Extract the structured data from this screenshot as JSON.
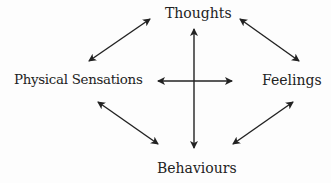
{
  "diagram": {
    "type": "cbt-cycle",
    "nodes": [
      {
        "id": "thoughts",
        "label": "Thoughts"
      },
      {
        "id": "physical",
        "label": "Physical Sensations"
      },
      {
        "id": "feelings",
        "label": "Feelings"
      },
      {
        "id": "behaviours",
        "label": "Behaviours"
      }
    ],
    "edges": [
      {
        "from": "thoughts",
        "to": "physical",
        "direction": "bidirectional"
      },
      {
        "from": "thoughts",
        "to": "feelings",
        "direction": "bidirectional"
      },
      {
        "from": "physical",
        "to": "behaviours",
        "direction": "bidirectional"
      },
      {
        "from": "feelings",
        "to": "behaviours",
        "direction": "bidirectional"
      },
      {
        "from": "thoughts",
        "to": "behaviours",
        "direction": "bidirectional"
      },
      {
        "from": "physical",
        "to": "feelings",
        "direction": "bidirectional"
      }
    ],
    "colors": {
      "arrow": "#222222",
      "text": "#222222",
      "background": "#ffffff"
    }
  }
}
